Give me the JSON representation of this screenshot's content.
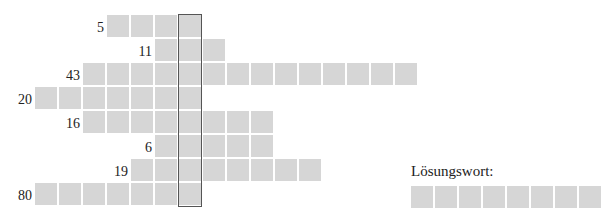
{
  "puzzle": {
    "cell_color": "#d6d6d6",
    "solution_column": 6,
    "rows": [
      {
        "clue_number": "5",
        "start_col": 3,
        "length": 4
      },
      {
        "clue_number": "11",
        "start_col": 5,
        "length": 3
      },
      {
        "clue_number": "43",
        "start_col": 2,
        "length": 14
      },
      {
        "clue_number": "20",
        "start_col": 0,
        "length": 7
      },
      {
        "clue_number": "16",
        "start_col": 2,
        "length": 8
      },
      {
        "clue_number": "6",
        "start_col": 5,
        "length": 5
      },
      {
        "clue_number": "19",
        "start_col": 4,
        "length": 8
      },
      {
        "clue_number": "80",
        "start_col": 0,
        "length": 7
      }
    ]
  },
  "solution": {
    "label": "Lösungswort:",
    "length": 8
  }
}
